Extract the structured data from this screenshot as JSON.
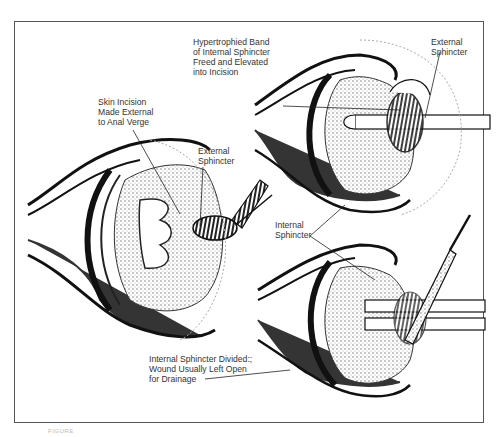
{
  "figure": {
    "labels": {
      "skin_incision": "Skin Incision\nMade External\nto Anal Verge",
      "external_sphincter_left": "External\nSphincter",
      "hypertrophied_band": "Hypertrophied Band\nof Internal Sphincter\nFreed and Elevated\ninto Incision",
      "external_sphincter_right": "External\nSphincter",
      "internal_sphincter": "Internal\nSphincter",
      "internal_divided": "Internal Sphincter Divided:;\nWound Usually Left Open\nfor Drainage"
    },
    "caption": "FIGURE"
  }
}
